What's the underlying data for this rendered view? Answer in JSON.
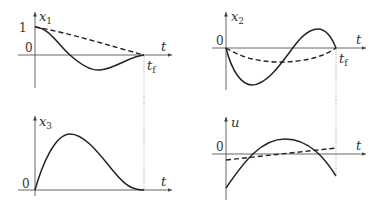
{
  "figure": {
    "panels": [
      {
        "id": "x1",
        "y_label": "x",
        "y_label_sub": "1",
        "x_label": "t",
        "tick_labels": [
          "1",
          "0"
        ],
        "end_label": "t",
        "end_label_sub": "f",
        "curves": [
          "solid",
          "dashed"
        ]
      },
      {
        "id": "x2",
        "y_label": "x",
        "y_label_sub": "2",
        "x_label": "t",
        "tick_labels": [
          "0"
        ],
        "end_label": "t",
        "end_label_sub": "f",
        "curves": [
          "solid",
          "dashed"
        ]
      },
      {
        "id": "x3",
        "y_label": "x",
        "y_label_sub": "3",
        "x_label": "t",
        "tick_labels": [
          "0"
        ],
        "curves": [
          "solid"
        ]
      },
      {
        "id": "u",
        "y_label": "u",
        "y_label_sub": "",
        "x_label": "t",
        "tick_labels": [
          "0"
        ],
        "curves": [
          "solid",
          "dashed"
        ]
      }
    ]
  }
}
